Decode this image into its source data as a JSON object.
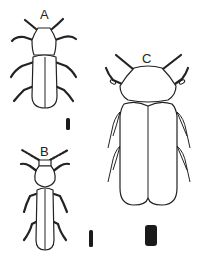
{
  "figure": {
    "background": "#ffffff",
    "ink_color": "#222222",
    "specimens": [
      {
        "id": "A",
        "label": "A",
        "scale_bar": "small"
      },
      {
        "id": "B",
        "label": "B",
        "scale_bar": "small"
      },
      {
        "id": "C",
        "label": "C",
        "scale_bar": "large"
      }
    ]
  }
}
